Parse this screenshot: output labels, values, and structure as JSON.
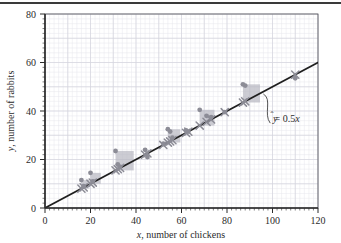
{
  "figure": {
    "title": "",
    "background_color": "#ffffff",
    "grid_color": "#e6e6ec",
    "grid_major_color": "#d4d4de",
    "axis_color": "#2b2b2b",
    "point_color": "#8c8c96",
    "marker_color": "#8c8c96",
    "residual_square_color": "#b9b9c2",
    "line_color": "#1f1f1f"
  },
  "chart_data": {
    "type": "scatter",
    "title": "",
    "subtitle": "",
    "xlabel": "x, number of chickens",
    "ylabel": "y, number of rabbits",
    "xlabel_italic_prefix": "x",
    "xlabel_rest": ", number of chickens",
    "ylabel_italic_prefix": "y",
    "ylabel_rest": ", number of rabbits",
    "xlim": [
      0,
      120
    ],
    "ylim": [
      0,
      80
    ],
    "xticks": [
      0,
      20,
      40,
      60,
      80,
      100,
      120
    ],
    "yticks": [
      0,
      20,
      40,
      60,
      80
    ],
    "xtick_labels": [
      "0",
      "20",
      "40",
      "60",
      "80",
      "100",
      "120"
    ],
    "ytick_labels": [
      "0",
      "20",
      "40",
      "60",
      "80"
    ],
    "minor_tick_step": 2,
    "grid": true,
    "legend": "none",
    "series": [
      {
        "name": "observed",
        "marker": "circle",
        "x": [
          16,
          17,
          20,
          21,
          31,
          32,
          33,
          44,
          45,
          52,
          54,
          55,
          56,
          62,
          63,
          68,
          71,
          73,
          79,
          87,
          88,
          110
        ],
        "y": [
          11.5,
          9.0,
          14.5,
          11.0,
          23.5,
          18.0,
          17.0,
          24.0,
          21.0,
          26.5,
          32.5,
          31.5,
          29.0,
          32.0,
          31.5,
          40.5,
          38.0,
          37.5,
          39.5,
          51.0,
          50.5,
          53.5
        ]
      },
      {
        "name": "predicted",
        "marker": "x",
        "equation": "y-hat = 0.5x",
        "x": [
          16,
          17,
          20,
          21,
          31,
          32,
          33,
          44,
          45,
          52,
          54,
          55,
          56,
          62,
          63,
          68,
          71,
          73,
          79,
          87,
          88,
          110
        ],
        "y": [
          8,
          8.5,
          10,
          10.5,
          15.5,
          16,
          16.5,
          22,
          22.5,
          26,
          27,
          27.5,
          28,
          31,
          31.5,
          34,
          35.5,
          36.5,
          39.5,
          43.5,
          44,
          55
        ]
      }
    ],
    "fit_line": {
      "label": "y-hat = 0.5x",
      "slope": 0.5,
      "intercept": 0,
      "x_start": 0,
      "x_end": 120,
      "y_start": 0,
      "y_end": 60
    },
    "residual_squares": [
      {
        "x": 16,
        "y_obs": 11.5,
        "y_pred": 8,
        "side": 3.5
      },
      {
        "x": 20,
        "y_obs": 14.5,
        "y_pred": 10,
        "side": 4.5
      },
      {
        "x": 31,
        "y_obs": 23.5,
        "y_pred": 15.5,
        "side": 8
      },
      {
        "x": 33,
        "y_obs": 17.0,
        "y_pred": 16.5,
        "side": 0.5
      },
      {
        "x": 44,
        "y_obs": 24.0,
        "y_pred": 22,
        "side": 2
      },
      {
        "x": 52,
        "y_obs": 26.5,
        "y_pred": 26,
        "side": 0.5
      },
      {
        "x": 54,
        "y_obs": 32.5,
        "y_pred": 27,
        "side": 5.5
      },
      {
        "x": 62,
        "y_obs": 32.0,
        "y_pred": 31,
        "side": 1
      },
      {
        "x": 68,
        "y_obs": 40.5,
        "y_pred": 34,
        "side": 6.5
      },
      {
        "x": 71,
        "y_obs": 38.0,
        "y_pred": 35.5,
        "side": 2.5
      },
      {
        "x": 87,
        "y_obs": 51.0,
        "y_pred": 43.5,
        "side": 7.5
      }
    ],
    "annotations": [
      {
        "name": "regression-equation",
        "text": "ŷ = 0.5x",
        "text_yhat": "y",
        "text_rest": " = 0.5",
        "text_x_italic": "x",
        "x_data": 100,
        "y_data": 32,
        "leader_from": {
          "x": 96,
          "y": 47
        },
        "leader_to": {
          "x": 99,
          "y": 35
        }
      }
    ]
  }
}
